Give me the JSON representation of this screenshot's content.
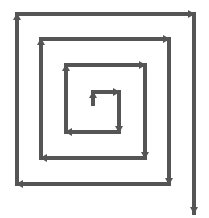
{
  "diagram": {
    "type": "square-spiral-arrow",
    "stroke_color": "#555555",
    "background_color": "#ffffff",
    "stroke_width": 4,
    "path_points": [
      [
        93,
        104
      ],
      [
        93,
        92
      ],
      [
        119,
        92
      ],
      [
        119,
        132
      ],
      [
        66,
        132
      ],
      [
        66,
        65
      ],
      [
        145,
        65
      ],
      [
        145,
        158
      ],
      [
        41,
        158
      ],
      [
        41,
        39
      ],
      [
        169,
        39
      ],
      [
        169,
        184
      ],
      [
        17,
        184
      ],
      [
        17,
        14
      ],
      [
        194,
        14
      ],
      [
        194,
        213
      ]
    ],
    "direction": "clockwise-outward",
    "end_arrow": "down"
  }
}
